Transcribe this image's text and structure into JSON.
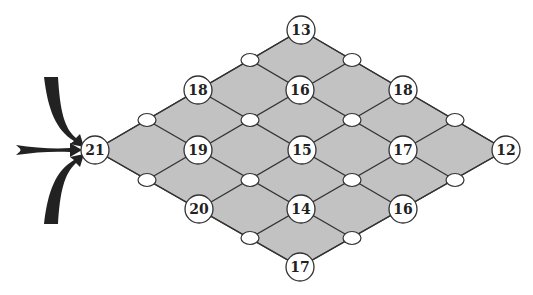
{
  "diagram": {
    "colors": {
      "fill": "#c2c2c2",
      "edge": "#333333",
      "node_fill": "#ffffff",
      "arrow": "#222222"
    },
    "nodes": [
      {
        "id": "n-top",
        "label": "13",
        "x": 301,
        "y": 30
      },
      {
        "id": "n-r1-left",
        "label": "18",
        "x": 198,
        "y": 90
      },
      {
        "id": "n-r1-mid",
        "label": "16",
        "x": 300,
        "y": 90
      },
      {
        "id": "n-r1-right",
        "label": "18",
        "x": 403,
        "y": 90
      },
      {
        "id": "n-left",
        "label": "21",
        "x": 95,
        "y": 150
      },
      {
        "id": "n-r2-a",
        "label": "19",
        "x": 198,
        "y": 150
      },
      {
        "id": "n-r2-b",
        "label": "15",
        "x": 302,
        "y": 150
      },
      {
        "id": "n-r2-c",
        "label": "17",
        "x": 403,
        "y": 150
      },
      {
        "id": "n-right",
        "label": "12",
        "x": 506,
        "y": 150
      },
      {
        "id": "n-r3-left",
        "label": "20",
        "x": 199,
        "y": 209
      },
      {
        "id": "n-r3-mid",
        "label": "14",
        "x": 301,
        "y": 209
      },
      {
        "id": "n-r3-right",
        "label": "16",
        "x": 403,
        "y": 209
      },
      {
        "id": "n-bottom",
        "label": "17",
        "x": 300,
        "y": 267
      }
    ]
  }
}
